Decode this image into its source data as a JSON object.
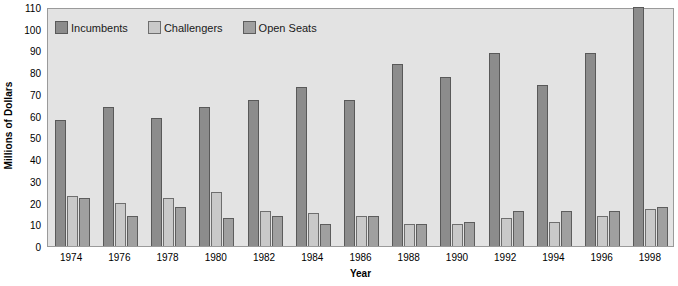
{
  "chart_data": {
    "type": "bar",
    "title": "",
    "xlabel": "Year",
    "ylabel": "Millions of Dollars",
    "categories": [
      "1974",
      "1976",
      "1978",
      "1980",
      "1982",
      "1984",
      "1986",
      "1988",
      "1990",
      "1992",
      "1994",
      "1996",
      "1998"
    ],
    "series": [
      {
        "name": "Incumbents",
        "color": "#8c8c8c",
        "values": [
          58,
          64,
          59,
          64,
          67,
          73,
          67,
          84,
          78,
          89,
          74,
          89,
          110
        ]
      },
      {
        "name": "Challengers",
        "color": "#c9c9c9",
        "values": [
          23,
          20,
          22,
          25,
          16,
          15,
          14,
          10,
          10,
          13,
          11,
          14,
          17
        ]
      },
      {
        "name": "Open Seats",
        "color": "#a0a0a0",
        "values": [
          22,
          14,
          18,
          13,
          14,
          10,
          14,
          10,
          11,
          16,
          16,
          16,
          18
        ]
      }
    ],
    "ylim": [
      0,
      110
    ],
    "y_ticks": [
      0,
      10,
      20,
      30,
      40,
      50,
      60,
      70,
      80,
      90,
      100,
      110
    ],
    "grid": false,
    "legend_position": "top-left",
    "plot_background": "#e3e3e3"
  }
}
